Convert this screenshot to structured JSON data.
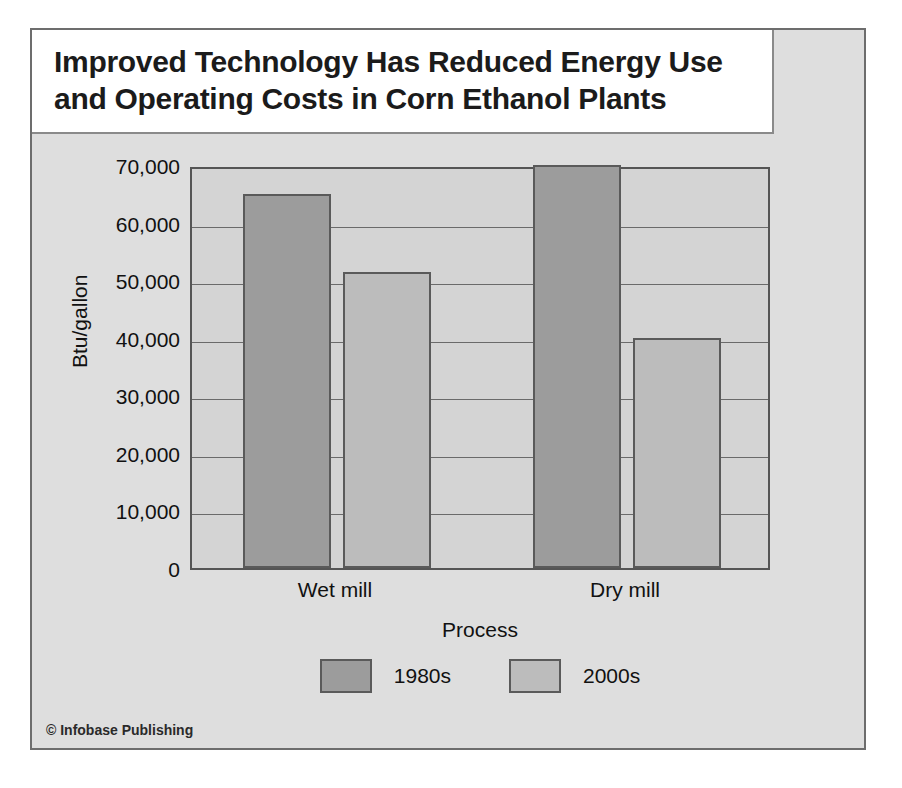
{
  "figure": {
    "credit": "© Infobase Publishing",
    "background_color": "#dedede",
    "border_color": "#6d6d6d"
  },
  "title": {
    "text": "Improved Technology Has Reduced Energy Use\nand Operating Costs in Corn Ethanol Plants"
  },
  "chart_data": {
    "type": "bar",
    "title": "Improved Technology Has Reduced Energy Use and Operating Costs in Corn Ethanol Plants",
    "xlabel": "Process",
    "ylabel": "Btu/gallon",
    "categories": [
      "Wet mill",
      "Dry mill"
    ],
    "series": [
      {
        "name": "1980s",
        "values": [
          65000,
          70000
        ],
        "color": "#9c9c9c"
      },
      {
        "name": "2000s",
        "values": [
          51500,
          40000
        ],
        "color": "#bcbcbc"
      }
    ],
    "ylim": [
      0,
      70000
    ],
    "ytick_values": [
      0,
      10000,
      20000,
      30000,
      40000,
      50000,
      60000,
      70000
    ],
    "ytick_labels": [
      "0",
      "10,000",
      "20,000",
      "30,000",
      "40,000",
      "50,000",
      "60,000",
      "70,000"
    ],
    "grid": true,
    "legend_position": "bottom",
    "plot_background": "#d4d4d4"
  }
}
